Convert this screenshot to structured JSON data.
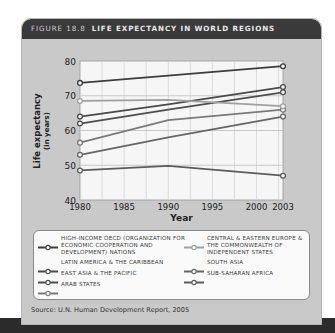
{
  "figure": {
    "number_label": "FIGURE 18.8",
    "title": "LIFE EXPECTANCY IN WORLD REGIONS",
    "source": "Source: U.N. Human Development Report, 2005"
  },
  "chart_data": {
    "type": "line",
    "title": "Life Expectancy in World Regions",
    "xlabel": "Year",
    "ylabel": "Life expectancy (in years)",
    "ylabel_line1": "Life expectancy",
    "ylabel_line2": "(in years)",
    "x": [
      1980,
      1990,
      2003
    ],
    "x_ticks": [
      "1980",
      "1985",
      "1990",
      "1995",
      "2000",
      "2003"
    ],
    "y_ticks": [
      "40",
      "50",
      "60",
      "70",
      "80"
    ],
    "ylim": [
      40,
      80
    ],
    "xlim": [
      1980,
      2003
    ],
    "grid": true,
    "legend_position": "bottom",
    "series": [
      {
        "name": "High-income OECD (Organization for Economic Cooperation and Development) nations",
        "values": [
          73.7,
          75.8,
          78.5
        ],
        "color": "#3d3d3d"
      },
      {
        "name": "Latin America & the Caribbean",
        "values": [
          64.0,
          67.5,
          72.5
        ],
        "color": "#4a4a4a"
      },
      {
        "name": "East Asia & the Pacific",
        "values": [
          62.0,
          66.0,
          71.0
        ],
        "color": "#4e4e4e"
      },
      {
        "name": "Arab States",
        "values": [
          56.5,
          63.0,
          66.0
        ],
        "color": "#7a7a7a"
      },
      {
        "name": "Central & Eastern Europe & the Commonwealth of Independent States",
        "values": [
          68.5,
          68.8,
          67.0
        ],
        "color": "#a0a0a0"
      },
      {
        "name": "South Asia",
        "values": [
          53.0,
          58.0,
          64.0
        ],
        "color": "#666666"
      },
      {
        "name": "Sub-Saharan Africa",
        "values": [
          48.5,
          49.8,
          47.0
        ],
        "color": "#5c5c5c"
      }
    ]
  },
  "legend": {
    "left": [
      {
        "label": "HIGH-INCOME OECD (ORGANIZATION FOR ECONOMIC COOPERATION AND DEVELOPMENT) NATIONS",
        "color": "#3d3d3d"
      },
      {
        "label": "LATIN AMERICA & THE CARIBBEAN",
        "color": "#4a4a4a"
      },
      {
        "label": "EAST ASIA & THE PACIFIC",
        "color": "#4e4e4e"
      },
      {
        "label": "ARAB STATES",
        "color": "#7a7a7a"
      }
    ],
    "right": [
      {
        "label": "CENTRAL & EASTERN EUROPE & THE COMMONWEALTH OF INDEPENDENT STATES",
        "color": "#a0a0a0"
      },
      {
        "label": "SOUTH ASIA",
        "color": "#666666"
      },
      {
        "label": "SUB-SAHARAN AFRICA",
        "color": "#5c5c5c"
      }
    ]
  }
}
